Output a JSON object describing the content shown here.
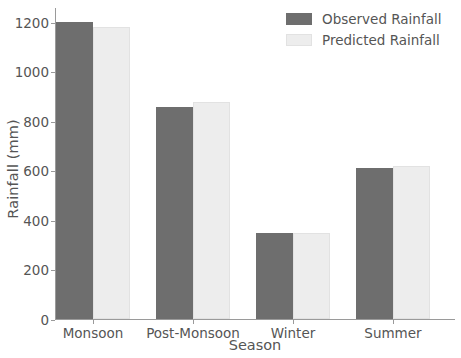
{
  "chart_data": {
    "type": "bar",
    "title": "",
    "xlabel": "Season",
    "ylabel": "Rainfall (mm)",
    "categories": [
      "Monsoon",
      "Post-Monsoon",
      "Winter",
      "Summer"
    ],
    "series": [
      {
        "name": "Observed Rainfall",
        "color": "#6e6e6e",
        "values": [
          1200,
          855,
          348,
          608
        ]
      },
      {
        "name": "Predicted Rainfall",
        "color": "#ededed",
        "values": [
          1180,
          878,
          348,
          617
        ]
      }
    ],
    "ylim": [
      0,
      1260
    ],
    "yticks": [
      0,
      200,
      400,
      600,
      800,
      1000,
      1200
    ],
    "ytick_labels": [
      "0",
      "200",
      "400",
      "600",
      "800",
      "1000",
      "1200"
    ],
    "grid": false,
    "legend_position": "upper right"
  },
  "legend": {
    "entries": [
      {
        "label": "Observed Rainfall"
      },
      {
        "label": "Predicted Rainfall"
      }
    ]
  },
  "axes": {
    "ylabel": "Rainfall (mm)",
    "xlabel": "Season"
  }
}
